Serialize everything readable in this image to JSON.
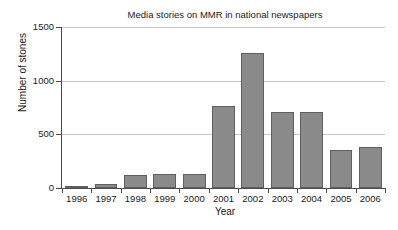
{
  "chart_data": {
    "type": "bar",
    "title": "Media stories on MMR in national newspapers",
    "xlabel": "Year",
    "ylabel": "Number of stones",
    "categories": [
      "1996",
      "1997",
      "1998",
      "1999",
      "2000",
      "2001",
      "2002",
      "2003",
      "2004",
      "2005",
      "2006"
    ],
    "values": [
      20,
      38,
      122,
      130,
      133,
      765,
      1255,
      710,
      705,
      355,
      382
    ],
    "ylim": [
      0,
      1500
    ],
    "yticks": [
      0,
      500,
      1000,
      1500
    ],
    "ytick_labels": [
      "0",
      "500",
      "1000",
      "1500"
    ],
    "grid": true,
    "legend": false,
    "bar_color": "#8a8a8a",
    "bar_edge_color": "#5e5e5e",
    "gridline_color": "#c8c8c8",
    "axis_color": "#4d4d4d",
    "background_color": "#ffffff"
  }
}
